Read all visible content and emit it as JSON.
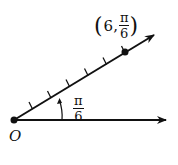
{
  "diagram": {
    "type": "polar-coordinate",
    "origin_label": "O",
    "angle_label": {
      "numerator": "π",
      "denominator": "6"
    },
    "point_label": {
      "open": "(",
      "r": "6,",
      "theta_numerator": "π",
      "theta_denominator": "6",
      "close": ")"
    },
    "point": {
      "r": 6,
      "theta": "π/6"
    },
    "tick_count": 6,
    "colors": {
      "stroke": "#111111",
      "background": "#ffffff"
    }
  }
}
